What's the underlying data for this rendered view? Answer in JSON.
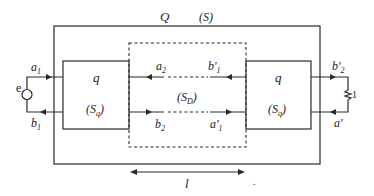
{
  "diagram": {
    "outer_box": {
      "label": "Q",
      "system_label": "(S)"
    },
    "left_block": {
      "label": "q",
      "sub_label": "(S",
      "sub_index": "q",
      "sub_close": ")"
    },
    "right_block": {
      "label": "q",
      "sub_label": "(S",
      "sub_index": "q",
      "sub_close": ")"
    },
    "middle_box": {
      "sub_label": "(S",
      "sub_index": "D",
      "sub_close": ")"
    },
    "source": {
      "label": "e"
    },
    "load": {
      "label": "1"
    },
    "waves": {
      "a1": {
        "base": "a",
        "sub": "1"
      },
      "b1": {
        "base": "b",
        "sub": "1"
      },
      "a2": {
        "base": "a",
        "sub": "2"
      },
      "b2": {
        "base": "b",
        "sub": "2"
      },
      "b1p": {
        "base": "b'",
        "sub": "1"
      },
      "a1p": {
        "base": "a'",
        "sub": "1"
      },
      "b2p": {
        "base": "b'",
        "sub": "2"
      },
      "ap": {
        "base": "a'"
      }
    },
    "length": {
      "label": "l"
    },
    "dot": "."
  }
}
